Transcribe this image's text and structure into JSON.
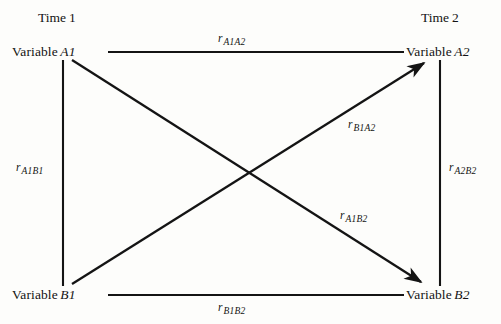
{
  "figure": {
    "type": "cross-lagged-panel-correlation-diagram",
    "background_color": "#fdfdfb",
    "line_color": "#141414"
  },
  "time_headers": [
    {
      "name": "time-1",
      "text": "Time",
      "number": "1",
      "x": 38,
      "y": 10
    },
    {
      "name": "time-2",
      "text": "Time",
      "number": "2",
      "x": 421,
      "y": 10
    }
  ],
  "nodes": [
    {
      "id": "A1",
      "name": "node-variable-a1",
      "label": "Variable",
      "symbol": "A1",
      "x": 12,
      "y": 44
    },
    {
      "id": "A2",
      "name": "node-variable-a2",
      "label": "Variable",
      "symbol": "A2",
      "x": 406,
      "y": 44
    },
    {
      "id": "B1",
      "name": "node-variable-b1",
      "label": "Variable",
      "symbol": "B1",
      "x": 12,
      "y": 287
    },
    {
      "id": "B2",
      "name": "node-variable-b2",
      "label": "Variable",
      "symbol": "B2",
      "x": 406,
      "y": 287
    }
  ],
  "correlations": [
    {
      "id": "rA1A2",
      "name": "correlation-label-a1a2",
      "r": "r",
      "subscript": "A1A2",
      "path": "A1-A2",
      "kind": "horizontal-top",
      "x": 218,
      "y": 31
    },
    {
      "id": "rA1B1",
      "name": "correlation-label-a1b1",
      "r": "r",
      "subscript": "A1B1",
      "path": "A1-B1",
      "kind": "vertical-left",
      "x": 16,
      "y": 160
    },
    {
      "id": "rA2B2",
      "name": "correlation-label-a2b2",
      "r": "r",
      "subscript": "A2B2",
      "path": "A2-B2",
      "kind": "vertical-right",
      "x": 449,
      "y": 160
    },
    {
      "id": "rB1B2",
      "name": "correlation-label-b1b2",
      "r": "r",
      "subscript": "B1B2",
      "path": "B1-B2",
      "kind": "horizontal-bottom",
      "x": 218,
      "y": 300
    },
    {
      "id": "rB1A2",
      "name": "correlation-label-b1a2",
      "r": "r",
      "subscript": "B1A2",
      "path": "B1-A2",
      "kind": "diagonal-cross-lagged",
      "x": 348,
      "y": 117
    },
    {
      "id": "rA1B2",
      "name": "correlation-label-a1b2",
      "r": "r",
      "subscript": "A1B2",
      "path": "A1-B2",
      "kind": "diagonal-cross-lagged",
      "x": 340,
      "y": 208
    }
  ],
  "edges": [
    {
      "id": "A1-A2",
      "name": "edge-a1-a2",
      "from": "A1",
      "to": "A2",
      "arrow": false,
      "x1": 108,
      "y1": 52,
      "x2": 404,
      "y2": 52
    },
    {
      "id": "A1-B1",
      "name": "edge-a1-b1",
      "from": "A1",
      "to": "B1",
      "arrow": false,
      "x1": 63,
      "y1": 60,
      "x2": 63,
      "y2": 286
    },
    {
      "id": "A2-B2",
      "name": "edge-a2-b2",
      "from": "A2",
      "to": "B2",
      "arrow": false,
      "x1": 440,
      "y1": 60,
      "x2": 440,
      "y2": 286
    },
    {
      "id": "B1-B2",
      "name": "edge-b1-b2",
      "from": "B1",
      "to": "B2",
      "arrow": false,
      "x1": 108,
      "y1": 295,
      "x2": 404,
      "y2": 295
    },
    {
      "id": "B1-A2",
      "name": "edge-b1-a2-arrow",
      "from": "B1",
      "to": "A2",
      "arrow": true,
      "x1": 72,
      "y1": 284,
      "x2": 429,
      "y2": 59
    },
    {
      "id": "A1-B2",
      "name": "edge-a1-b2-arrow",
      "from": "A1",
      "to": "B2",
      "arrow": true,
      "x1": 72,
      "y1": 60,
      "x2": 426,
      "y2": 286
    }
  ]
}
